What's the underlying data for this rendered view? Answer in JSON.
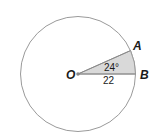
{
  "diagram": {
    "type": "circle-sector",
    "center_label": "O",
    "point_a_label": "A",
    "point_b_label": "B",
    "angle_label": "24°",
    "radius_label": "22",
    "colors": {
      "circle_stroke": "#9a9a9a",
      "sector_fill": "#d9d9d9",
      "text": "#1a1a1a"
    }
  }
}
